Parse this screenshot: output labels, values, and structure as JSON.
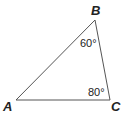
{
  "diagram": {
    "type": "triangle",
    "vertices": [
      {
        "name": "A",
        "x": 16,
        "y": 100
      },
      {
        "name": "B",
        "x": 95,
        "y": 20
      },
      {
        "name": "C",
        "x": 110,
        "y": 100
      }
    ],
    "labels": {
      "A": "A",
      "B": "B",
      "C": "C"
    },
    "angles": {
      "B": "60°",
      "C": "80°"
    },
    "colors": {
      "line": "#555555",
      "text": "#222222"
    }
  }
}
